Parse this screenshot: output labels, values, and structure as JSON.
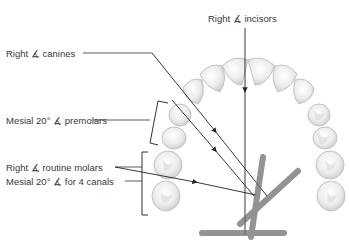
{
  "diagram": {
    "labels": {
      "incisors": "Right ∡ incisors",
      "canines": "Right ∡ canines",
      "premolars": "Mesial 20° ∡ premolars",
      "molars": "Right ∡ routine molars",
      "four_canals": "Mesial 20° ∡ for 4 canals"
    },
    "colors": {
      "text": "#3a3a3a",
      "line": "#333333",
      "tooth_fill": "#f2f2f2",
      "tooth_stroke": "#c8c8c8",
      "tube": "#777777"
    }
  }
}
